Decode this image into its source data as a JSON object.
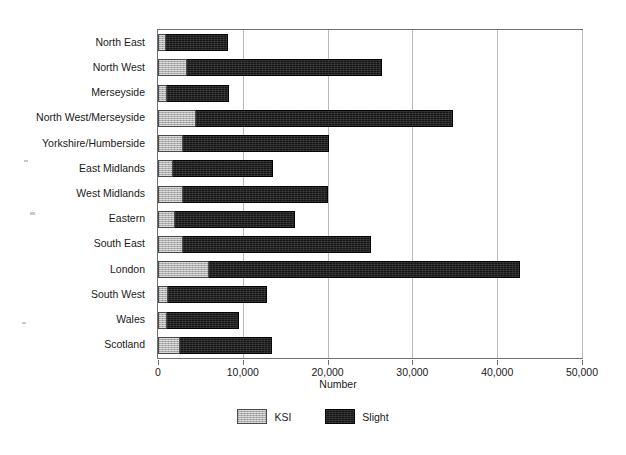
{
  "chart_data": {
    "type": "bar",
    "orientation": "horizontal",
    "stacked": true,
    "title": "",
    "xlabel": "Number",
    "ylabel": "",
    "xlim": [
      0,
      50000
    ],
    "xticks": [
      "0",
      "10,000",
      "20,000",
      "30,000",
      "40,000",
      "50,000"
    ],
    "xtick_values": [
      0,
      10000,
      20000,
      30000,
      40000,
      50000
    ],
    "grid": "vertical",
    "legend_position": "bottom",
    "categories": [
      "North East",
      "North West",
      "Merseyside",
      "North West/Merseyside",
      "Yorkshire/Humberside",
      "East Midlands",
      "West Midlands",
      "Eastern",
      "South East",
      "London",
      "South West",
      "Wales",
      "Scotland"
    ],
    "series": [
      {
        "name": "KSI",
        "color": "#b0b0b0",
        "values": [
          900,
          3400,
          1100,
          4500,
          3000,
          1800,
          2900,
          2000,
          3000,
          6000,
          1200,
          1100,
          2600
        ]
      },
      {
        "name": "Slight",
        "color": "#161616",
        "values": [
          7400,
          23000,
          7300,
          30300,
          17200,
          11800,
          17100,
          14100,
          22100,
          36700,
          11700,
          8500,
          10900
        ]
      }
    ],
    "totals": [
      8300,
      26400,
      8400,
      34800,
      20200,
      13600,
      20000,
      16100,
      25100,
      42700,
      12900,
      9600,
      13500
    ]
  },
  "legend": {
    "items": [
      {
        "label": "KSI",
        "swatch": "ksi-swatch"
      },
      {
        "label": "Slight",
        "swatch": "slight-swatch"
      }
    ]
  }
}
